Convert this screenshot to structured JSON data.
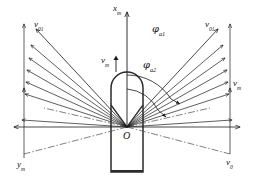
{
  "figure": {
    "type": "technical-vector-diagram",
    "background_color": "#ffffff",
    "line_color": "#1a1a1a",
    "body_outline_color": "#2b2b2b"
  },
  "labels": {
    "axis_x": {
      "base": "x",
      "sub": "m",
      "x": 113,
      "y": 4
    },
    "axis_y": {
      "base": "y",
      "sub": "m",
      "x": 17,
      "y": 160
    },
    "velocity_center": {
      "base": "v",
      "sub": "m",
      "x": 101,
      "y": 56
    },
    "velocity_right": {
      "base": "v",
      "sub": "m",
      "x": 230,
      "y": 79
    },
    "velocity_initial_left": {
      "base": "v",
      "sub": "01",
      "x": 34,
      "y": 22
    },
    "velocity_initial_right": {
      "base": "v",
      "sub": "01",
      "x": 205,
      "y": 22
    },
    "velocity_zero": {
      "base": "v",
      "sub": "0",
      "x": 226,
      "y": 158
    },
    "origin": {
      "base": "O",
      "sub": "",
      "x": 123,
      "y": 131
    },
    "angle_1": {
      "base": "φ",
      "sub": "a1",
      "x": 152,
      "y": 26
    },
    "angle_2": {
      "base": "φ",
      "sub": "a2",
      "x": 143,
      "y": 62
    }
  },
  "geometry": {
    "origin_point": {
      "x": 127,
      "y": 127
    },
    "body": {
      "left": 111,
      "right": 143,
      "top": 72,
      "bottom": 172,
      "nose_radius": 16,
      "notch_depth": 22
    },
    "axes": {
      "vertical_top_y": 8,
      "horizontal_left_x": 8,
      "horizontal_right_x": 246,
      "horizontal_y": 127
    },
    "fan_rays_per_side": 6,
    "arc_1_radius": 52,
    "arc_2_radius": 38
  },
  "arrow_heads": {
    "style": "open-v",
    "count": 14
  }
}
